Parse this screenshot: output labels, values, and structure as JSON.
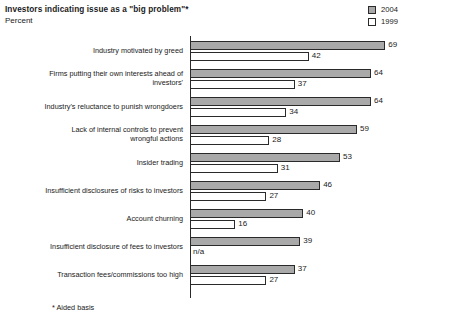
{
  "header": {
    "title": "Investors indicating issue as a \"big problem\"*",
    "subtitle": "Percent"
  },
  "legend": {
    "position": "top-right",
    "entries": [
      {
        "label": "2004",
        "color": "#a9a9a9",
        "swatch": "filled-gray-swatch"
      },
      {
        "label": "1999",
        "color": "#ffffff",
        "swatch": "empty-white-swatch"
      }
    ]
  },
  "footnote": "* Aided basis",
  "chart_data": {
    "type": "bar",
    "orientation": "horizontal",
    "title": "Investors indicating issue as a \"big problem\"*",
    "subtitle": "Percent",
    "xlabel": "Percent",
    "ylabel": "",
    "xlim": [
      0,
      69
    ],
    "grid": false,
    "axis_visible": "y-axis-only",
    "legend_position": "top-right",
    "categories": [
      "Industry motivated by greed",
      "Firms putting their own interests ahead of investors'",
      "Industry's reluctance to punish wrongdoers",
      "Lack of internal controls to prevent wrongful actions",
      "Insider trading",
      "Insufficient disclosures of risks to investors",
      "Account churning",
      "Insufficient disclosure of fees to investors",
      "Transaction fees/commissions too high"
    ],
    "category_lines": [
      [
        "Industry motivated by greed"
      ],
      [
        "Firms putting their own interests ahead of",
        "investors'"
      ],
      [
        "Industry's reluctance to punish wrongdoers"
      ],
      [
        "Lack of internal controls to prevent",
        "wrongful actions"
      ],
      [
        "Insider trading"
      ],
      [
        "Insufficient disclosures of risks to investors"
      ],
      [
        "Account churning"
      ],
      [
        "Insufficient disclosure of fees to investors"
      ],
      [
        "Transaction fees/commissions too high"
      ]
    ],
    "series": [
      {
        "name": "2004",
        "color": "#a9a9a9",
        "values": [
          69,
          64,
          64,
          59,
          53,
          46,
          40,
          39,
          37
        ],
        "labels": [
          "69",
          "64",
          "64",
          "59",
          "53",
          "46",
          "40",
          "39",
          "37"
        ]
      },
      {
        "name": "1999",
        "color": "#ffffff",
        "values": [
          42,
          37,
          34,
          28,
          31,
          27,
          16,
          null,
          27
        ],
        "labels": [
          "42",
          "37",
          "34",
          "28",
          "31",
          "27",
          "16",
          "n/a",
          "27"
        ]
      }
    ]
  }
}
